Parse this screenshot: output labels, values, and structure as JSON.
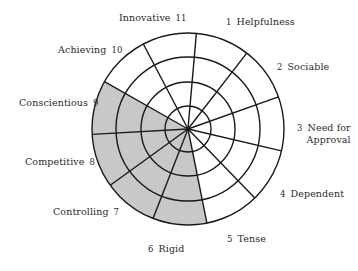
{
  "diagram": {
    "type": "segmented-wheel",
    "center": [
      188,
      129
    ],
    "ring_radii": [
      23,
      47,
      72,
      96
    ],
    "start_angle_deg": 5,
    "sector_count": 11,
    "colors": {
      "stroke": "#1a1a1a",
      "shaded": "#c8c8c8",
      "unshaded": "#ffffff"
    },
    "segments": [
      {
        "number": "1",
        "name": "Helpfulness",
        "shaded": false
      },
      {
        "number": "2",
        "name": "Sociable",
        "shaded": false
      },
      {
        "number": "3",
        "name": "Need for Approval",
        "line1": "Need for",
        "line2": "Approval",
        "shaded": false
      },
      {
        "number": "4",
        "name": "Dependent",
        "shaded": false
      },
      {
        "number": "5",
        "name": "Tense",
        "shaded": false
      },
      {
        "number": "6",
        "name": "Rigid",
        "shaded": true
      },
      {
        "number": "7",
        "name": "Controlling",
        "shaded": true
      },
      {
        "number": "8",
        "name": "Competitive",
        "shaded": true
      },
      {
        "number": "9",
        "name": "Conscientious",
        "shaded": true
      },
      {
        "number": "10",
        "name": "Achieving",
        "shaded": false
      },
      {
        "number": "11",
        "name": "Innovative",
        "shaded": false
      }
    ]
  }
}
